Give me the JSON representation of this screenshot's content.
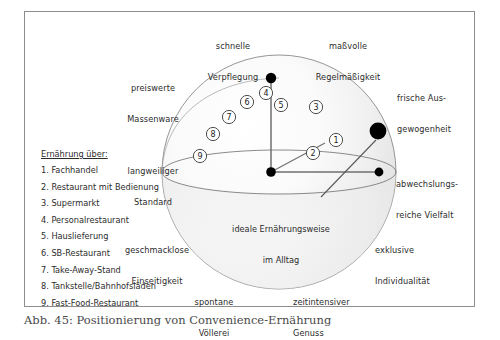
{
  "figure": {
    "caption": "Abb. 45: Positionierung von Convenience-Ernährung",
    "center_label_line1": "ideale Ernährungsweise",
    "center_label_line2": "im Alltag"
  },
  "axis_labels": {
    "top_left_line1": "schnelle",
    "top_left_line2": "Verpflegung",
    "top_right_line1": "maßvolle",
    "top_right_line2": "Regelmäßigkeit",
    "left_upper_line1": "preiswerte",
    "left_upper_line2": "Massenware",
    "right_upper_line1": "frische Aus-",
    "right_upper_line2": "gewogenheit",
    "left_mid_line1": "langweiliger",
    "left_mid_line2": "Standard",
    "right_mid_line1": "abwechslungs-",
    "right_mid_line2": "reiche Vielfalt",
    "left_lower_line1": "geschmacklose",
    "left_lower_line2": "Einseitigkeit",
    "right_lower_line1": "exklusive",
    "right_lower_line2": "Individualität",
    "bottom_left_line1": "spontane",
    "bottom_left_line2": "Völlerei",
    "bottom_right_line1": "zeitintensiver",
    "bottom_right_line2": "Genuss"
  },
  "legend": {
    "title": "Ernährung über:",
    "items": [
      "1. Fachhandel",
      "2. Restaurant mit Bedienung",
      "3. Supermarkt",
      "4. Personalrestaurant",
      "5. Hauslieferung",
      "6. SB-Restaurant",
      "7. Take-Away-Stand",
      "8. Tankstelle/Bahnhofsläden",
      "9. Fast-Food-Restaurant"
    ]
  },
  "markers": [
    {
      "id": "1",
      "label": "1",
      "x": 321,
      "y": 130
    },
    {
      "id": "2",
      "label": "2",
      "x": 297,
      "y": 143
    },
    {
      "id": "3",
      "label": "3",
      "x": 290,
      "y": 97
    },
    {
      "id": "4",
      "label": "4",
      "x": 241,
      "y": 82
    },
    {
      "id": "5",
      "label": "5",
      "x": 255,
      "y": 94
    },
    {
      "id": "6",
      "label": "6",
      "x": 222,
      "y": 91
    },
    {
      "id": "7",
      "label": "7",
      "x": 205,
      "y": 106
    },
    {
      "id": "8",
      "label": "8",
      "x": 190,
      "y": 123
    },
    {
      "id": "9",
      "label": "9",
      "x": 177,
      "y": 145
    }
  ],
  "dots": [
    {
      "name": "origin-dot",
      "x": 270,
      "y": 159,
      "r": 4.2
    },
    {
      "name": "top-axis-dot",
      "x": 270,
      "y": 66,
      "r": 4.6
    },
    {
      "name": "right-axis-dot",
      "x": 378,
      "y": 159,
      "r": 4.2
    },
    {
      "name": "ideal-position-dot",
      "x": 375,
      "y": 124,
      "r": 7.8
    }
  ],
  "colors": {
    "frame_border": "#8d8d8d",
    "sphere_outline": "#8a8a8a",
    "marker_fill": "#ffffff",
    "marker_stroke": "#3a3a3a",
    "dot_fill": "#000000",
    "text": "#2c2c2c",
    "caption_text": "#4a4a4a",
    "page_background": "#ffffff"
  }
}
